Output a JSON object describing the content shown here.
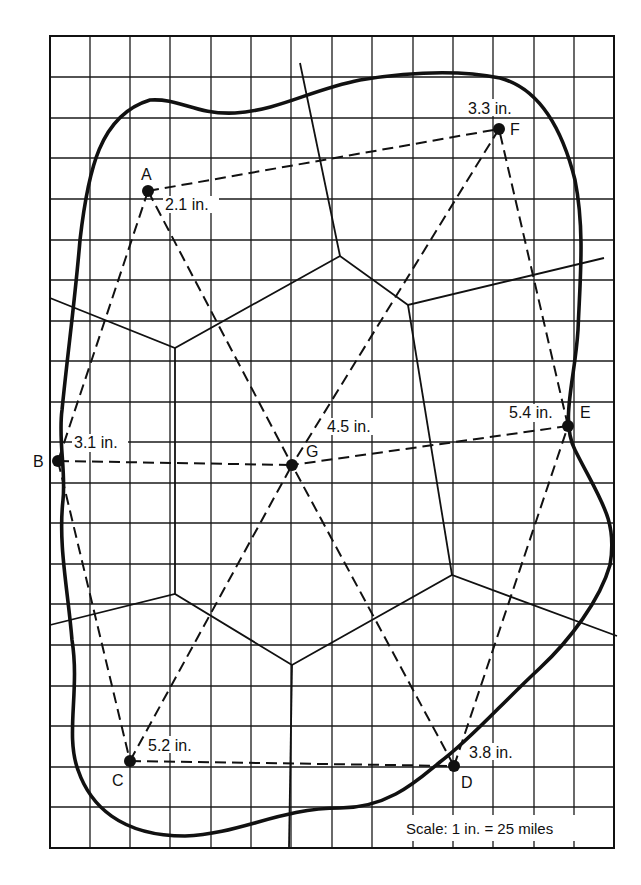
{
  "diagram": {
    "scale_label": "Scale:  1 in. = 25 miles",
    "grid": {
      "x0": 50,
      "y0": 36,
      "x1": 614,
      "y1": 848,
      "cols": 14,
      "rows": 20
    },
    "stations": [
      {
        "id": "A",
        "label": "A",
        "rainfall": "2.1 in.",
        "x": 148,
        "y": 191
      },
      {
        "id": "B",
        "label": "B",
        "rainfall": "3.1 in.",
        "x": 58,
        "y": 461
      },
      {
        "id": "C",
        "label": "C",
        "rainfall": "5.2 in.",
        "x": 130,
        "y": 761
      },
      {
        "id": "D",
        "label": "D",
        "rainfall": "3.8 in.",
        "x": 454,
        "y": 766
      },
      {
        "id": "E",
        "label": "E",
        "rainfall": "5.4 in.",
        "x": 568,
        "y": 426
      },
      {
        "id": "F",
        "label": "F",
        "rainfall": "3.3 in.",
        "x": 499,
        "y": 129
      },
      {
        "id": "G",
        "label": "G",
        "rainfall": "4.5 in.",
        "x": 292,
        "y": 465
      }
    ],
    "triangulation": [
      [
        "A",
        "F"
      ],
      [
        "A",
        "B"
      ],
      [
        "A",
        "G"
      ],
      [
        "B",
        "G"
      ],
      [
        "B",
        "C"
      ],
      [
        "C",
        "G"
      ],
      [
        "C",
        "D"
      ],
      [
        "D",
        "G"
      ],
      [
        "D",
        "E"
      ],
      [
        "E",
        "G"
      ],
      [
        "E",
        "F"
      ],
      [
        "F",
        "G"
      ]
    ]
  }
}
